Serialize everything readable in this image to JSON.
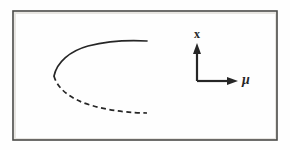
{
  "figure": {
    "kind": "bifurcation-diagram",
    "name": "saddle-node-bifurcation",
    "background_color": "#fefefe",
    "frame": {
      "name": "figure-border",
      "x": 13,
      "y": 11,
      "width": 264,
      "height": 129,
      "stroke_color": "#4a4a48",
      "stroke_width": 1.6,
      "inner_highlight_color": "#e8e6e2"
    },
    "curve_color": "#262626",
    "curve_width": 1.7
  },
  "axes": {
    "name": "axis-indicator",
    "origin_x": 197,
    "origin_y": 81,
    "color": "#262626",
    "stroke_width": 2.2,
    "vertical": {
      "name": "x-axis-arrow",
      "label": "x",
      "tip_x": 197,
      "tip_y": 43,
      "arrowhead_width": 8,
      "arrowhead_height": 11
    },
    "horizontal": {
      "name": "mu-axis-arrow",
      "label": "μ",
      "tip_x": 238,
      "tip_y": 81,
      "arrowhead_width": 11,
      "arrowhead_height": 8
    }
  },
  "chart_data": {
    "type": "line",
    "title": "",
    "xlabel": "μ",
    "ylabel": "x",
    "grid": false,
    "legend": false,
    "annotations": [
      {
        "name": "fold-point",
        "label": "",
        "x": 54,
        "y": 76
      }
    ],
    "series": [
      {
        "name": "stable-branch",
        "style": "solid",
        "label": "",
        "color": "#262626",
        "path": "M 54,76 C 57,62 70,51 88,46 C 108,41 130,40 147,41"
      },
      {
        "name": "unstable-branch",
        "style": "dashed",
        "label": "",
        "color": "#262626",
        "dash_pattern": "5 3.5",
        "path": "M 54,76 C 57,88 70,99 90,105 C 110,111 132,113 147,113"
      }
    ]
  }
}
